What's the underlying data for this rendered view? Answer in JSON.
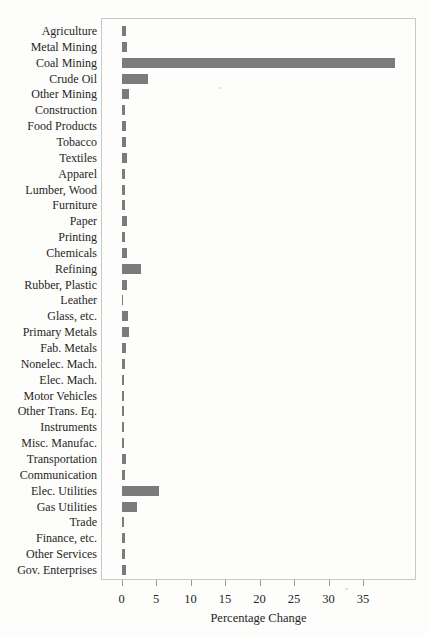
{
  "chart_data": {
    "type": "bar",
    "orientation": "horizontal",
    "title": "",
    "xlabel": "Percentage Change",
    "ylabel": "",
    "xlim": [
      -3,
      43
    ],
    "x_ticks": [
      0,
      5,
      10,
      15,
      20,
      25,
      30,
      35
    ],
    "grid": false,
    "legend": "none",
    "bar_color": "#7b7b7b",
    "categories": [
      "Agriculture",
      "Metal Mining",
      "Coal Mining",
      "Crude Oil",
      "Other Mining",
      "Construction",
      "Food Products",
      "Tobacco",
      "Textiles",
      "Apparel",
      "Lumber, Wood",
      "Furniture",
      "Paper",
      "Printing",
      "Chemicals",
      "Refining",
      "Rubber, Plastic",
      "Leather",
      "Glass, etc.",
      "Primary Metals",
      "Fab. Metals",
      "Nonelec. Mach.",
      "Elec. Mach.",
      "Motor Vehicles",
      "Other Trans. Eq.",
      "Instruments",
      "Misc. Manufac.",
      "Transportation",
      "Communication",
      "Elec. Utilities",
      "Gas Utilities",
      "Trade",
      "Finance, etc.",
      "Other Services",
      "Gov. Enterprises"
    ],
    "values": [
      0.7,
      0.8,
      39.7,
      3.8,
      1.1,
      0.45,
      0.6,
      0.6,
      0.8,
      0.45,
      0.55,
      0.5,
      0.8,
      0.55,
      0.85,
      2.8,
      0.85,
      0.15,
      0.95,
      1.1,
      0.7,
      0.5,
      0.35,
      0.35,
      0.4,
      0.4,
      0.3,
      0.6,
      0.5,
      5.5,
      2.2,
      0.4,
      0.45,
      0.45,
      0.7
    ]
  },
  "colors": {
    "bar": "#7b7b7b",
    "plot_border": "#c9c9c4",
    "text": "#262626",
    "background": "#fdfdfb"
  }
}
